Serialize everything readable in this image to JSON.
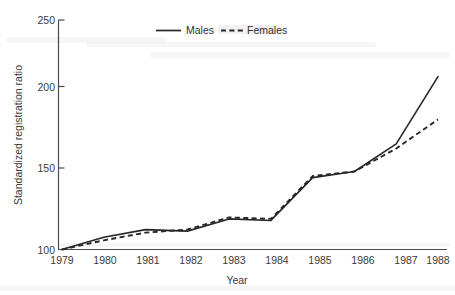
{
  "chart_data": {
    "type": "line",
    "title": "",
    "xlabel": "Year",
    "ylabel": "Standardized registration ratio",
    "x": [
      1979,
      1980,
      1981,
      1982,
      1983,
      1984,
      1985,
      1986,
      1987,
      1988
    ],
    "categories": [
      "1979",
      "1980",
      "1981",
      "1982",
      "1983",
      "1984",
      "1985",
      "1986",
      "1987",
      "1988"
    ],
    "series": [
      {
        "name": "Males",
        "style": "solid",
        "values": [
          100,
          108,
          113,
          112,
          120,
          119,
          147,
          151,
          169,
          213
        ]
      },
      {
        "name": "Females",
        "style": "dashed",
        "values": [
          100,
          106,
          111,
          113,
          121,
          120,
          148,
          151,
          166,
          185
        ]
      }
    ],
    "xlim": [
      1979,
      1988
    ],
    "ylim": [
      100,
      250
    ],
    "yticks": [
      100,
      150,
      200,
      250
    ],
    "ytick_labels": [
      "100",
      "150",
      "200",
      "250"
    ],
    "xticks": [
      1979,
      1980,
      1981,
      1982,
      1983,
      1984,
      1985,
      1986,
      1987,
      1988
    ],
    "xtick_labels": [
      "1979",
      "1980",
      "1981",
      "1982",
      "1983",
      "1984",
      "1985",
      "1986",
      "1987",
      "1988"
    ],
    "grid": false,
    "legend_position": "top-center",
    "legend": [
      "Males",
      "Females"
    ],
    "line_color": "#272727",
    "background_color": "#ffffff"
  },
  "axes": {
    "y_title": "Standardized registration ratio",
    "x_title": "Year",
    "y_ticks": [
      {
        "label": "250"
      },
      {
        "label": "200"
      },
      {
        "label": "150"
      },
      {
        "label": "100"
      }
    ],
    "x_ticks": [
      {
        "label": "1979"
      },
      {
        "label": "1980"
      },
      {
        "label": "1981"
      },
      {
        "label": "1982"
      },
      {
        "label": "1983"
      },
      {
        "label": "1984"
      },
      {
        "label": "1985"
      },
      {
        "label": "1986"
      },
      {
        "label": "1987"
      },
      {
        "label": "1988"
      }
    ]
  },
  "legend": {
    "entries": [
      {
        "label": "Males",
        "style": "solid"
      },
      {
        "label": "Females",
        "style": "dashed"
      }
    ]
  }
}
